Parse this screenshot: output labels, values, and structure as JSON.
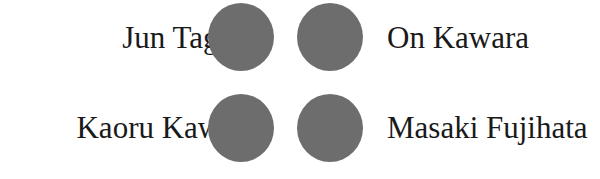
{
  "diagram": {
    "nodes": [
      {
        "label": "Jun Tagami",
        "row": 1,
        "side": "left"
      },
      {
        "label": "On Kawara",
        "row": 1,
        "side": "right"
      },
      {
        "label": "Kaoru Kawano",
        "row": 2,
        "side": "left"
      },
      {
        "label": "Masaki Fujihata",
        "row": 2,
        "side": "right"
      }
    ],
    "dot_color": "#6d6d6d"
  }
}
